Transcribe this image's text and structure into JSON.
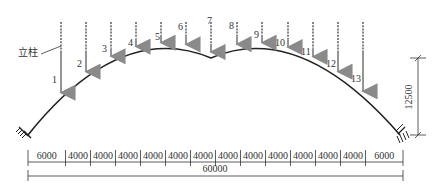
{
  "diagram": {
    "type": "arch-structure-elevation",
    "column_label": "立柱",
    "columns": [
      {
        "id": "1",
        "x": 61,
        "top": 22,
        "label_x": 52,
        "label_y": 83
      },
      {
        "id": "2",
        "x": 86,
        "top": 22,
        "label_x": 77,
        "label_y": 67
      },
      {
        "id": "3",
        "x": 111,
        "top": 22,
        "label_x": 102,
        "label_y": 52
      },
      {
        "id": "4",
        "x": 136,
        "top": 22,
        "label_x": 128,
        "label_y": 46
      },
      {
        "id": "5",
        "x": 161,
        "top": 22,
        "label_x": 155,
        "label_y": 40
      },
      {
        "id": "6",
        "x": 186,
        "top": 22,
        "label_x": 178,
        "label_y": 30
      },
      {
        "id": "7",
        "x": 211,
        "top": 22,
        "label_x": 207,
        "label_y": 24
      },
      {
        "id": "8",
        "x": 237,
        "top": 22,
        "label_x": 229,
        "label_y": 29
      },
      {
        "id": "9",
        "x": 262,
        "top": 22,
        "label_x": 254,
        "label_y": 38
      },
      {
        "id": "10",
        "x": 288,
        "top": 22,
        "label_x": 275,
        "label_y": 46
      },
      {
        "id": "11",
        "x": 313,
        "top": 22,
        "label_x": 301,
        "label_y": 55
      },
      {
        "id": "12",
        "x": 338,
        "top": 22,
        "label_x": 326,
        "label_y": 67
      },
      {
        "id": "13",
        "x": 363,
        "top": 22,
        "label_x": 351,
        "label_y": 82
      }
    ],
    "span_segments": [
      "6000",
      "4000",
      "4000",
      "4000",
      "4000",
      "4000",
      "4000",
      "4000",
      "4000",
      "4000",
      "4000",
      "4000",
      "4000",
      "6000"
    ],
    "total_span": "60000",
    "rise": "12500",
    "colors": {
      "arch": "#222222",
      "arrow": "#8a8a8a",
      "column_dash": "#333333",
      "dimension": "#333333"
    }
  }
}
